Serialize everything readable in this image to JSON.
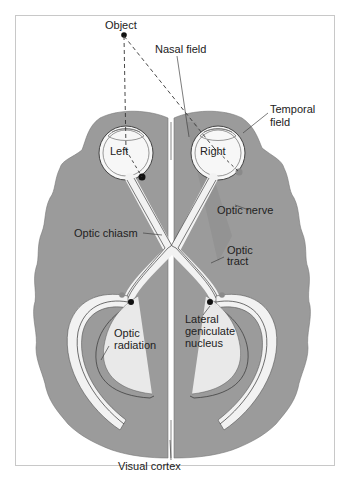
{
  "figure": {
    "type": "diagram"
  },
  "labels": {
    "object": "Object",
    "nasal_field": "Nasal field",
    "temporal_field_line1": "Temporal",
    "temporal_field_line2": "field",
    "left_eye": "Left",
    "right_eye": "Right",
    "optic_nerve": "Optic nerve",
    "optic_chiasm": "Optic chiasm",
    "optic_tract_line1": "Optic",
    "optic_tract_line2": "tract",
    "lgn_line1": "Lateral",
    "lgn_line2": "geniculate",
    "lgn_line3": "nucleus",
    "optic_radiation_line1": "Optic",
    "optic_radiation_line2": "radiation",
    "visual_cortex": "Visual cortex"
  },
  "colors": {
    "brain": "#9a9a9a",
    "brain_dark": "#8c8c8c",
    "pathway": "#f2f2f2",
    "pathway_line": "#333333",
    "eye_fill": "#f7f7f7",
    "frame_border": "#c8c8c8",
    "lgn_dot_dark": "#111111",
    "lgn_dot_gray": "#8a8a8a",
    "text": "#222222"
  }
}
